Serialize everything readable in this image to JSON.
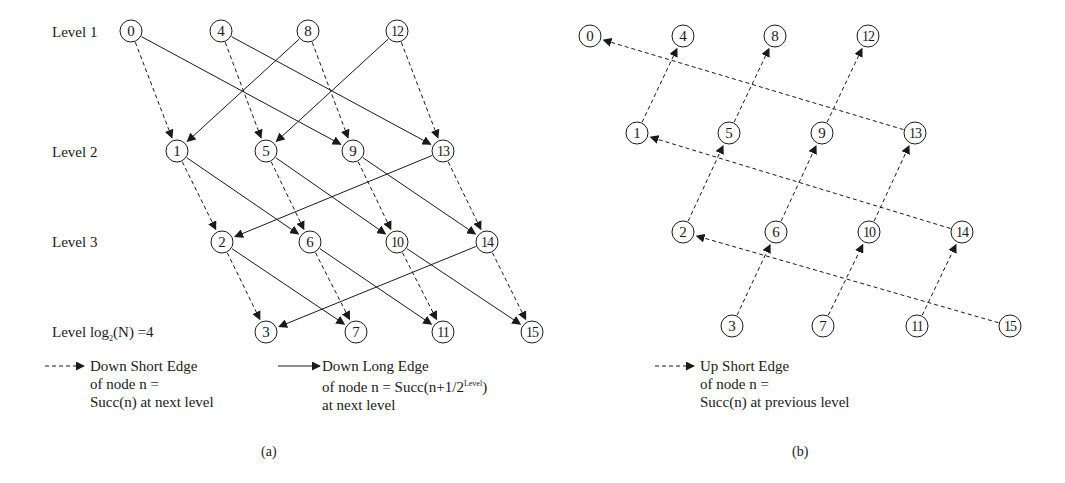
{
  "panel_a": {
    "caption": "(a)",
    "level_labels": [
      {
        "text": "Level  1",
        "x": 52,
        "y": 23
      },
      {
        "text": "Level  2",
        "x": 52,
        "y": 143
      },
      {
        "text": "Level  3",
        "x": 52,
        "y": 233
      },
      {
        "text_prefix": "Level  log",
        "subscript": "2",
        "text_suffix": "(N) =4",
        "x": 52,
        "y": 323
      }
    ],
    "nodes": [
      {
        "id": "0",
        "x": 131,
        "y": 31
      },
      {
        "id": "4",
        "x": 221,
        "y": 31
      },
      {
        "id": "8",
        "x": 308,
        "y": 31
      },
      {
        "id": "12",
        "x": 397,
        "y": 31
      },
      {
        "id": "1",
        "x": 177,
        "y": 151
      },
      {
        "id": "5",
        "x": 266,
        "y": 151
      },
      {
        "id": "9",
        "x": 353,
        "y": 151
      },
      {
        "id": "13",
        "x": 443,
        "y": 151
      },
      {
        "id": "2",
        "x": 222,
        "y": 242
      },
      {
        "id": "6",
        "x": 310,
        "y": 242
      },
      {
        "id": "10",
        "x": 397,
        "y": 242
      },
      {
        "id": "14",
        "x": 487,
        "y": 242
      },
      {
        "id": "3",
        "x": 266,
        "y": 332
      },
      {
        "id": "7",
        "x": 356,
        "y": 332
      },
      {
        "id": "11",
        "x": 443,
        "y": 332
      },
      {
        "id": "15",
        "x": 532,
        "y": 332
      }
    ],
    "short_edges": [
      [
        "0",
        "1"
      ],
      [
        "4",
        "5"
      ],
      [
        "8",
        "9"
      ],
      [
        "12",
        "13"
      ],
      [
        "1",
        "2"
      ],
      [
        "5",
        "6"
      ],
      [
        "9",
        "10"
      ],
      [
        "13",
        "14"
      ],
      [
        "2",
        "3"
      ],
      [
        "6",
        "7"
      ],
      [
        "10",
        "11"
      ],
      [
        "14",
        "15"
      ]
    ],
    "long_edges": [
      [
        "0",
        "9"
      ],
      [
        "4",
        "13"
      ],
      [
        "8",
        "1"
      ],
      [
        "12",
        "5"
      ],
      [
        "1",
        "6"
      ],
      [
        "5",
        "10"
      ],
      [
        "9",
        "14"
      ],
      [
        "13",
        "2"
      ],
      [
        "2",
        "7"
      ],
      [
        "6",
        "11"
      ],
      [
        "10",
        "15"
      ],
      [
        "14",
        "3"
      ]
    ],
    "legend": {
      "short": {
        "line1": "Down Short Edge",
        "line2": "of node n =",
        "line3": "Succ(n) at next level"
      },
      "long": {
        "line1": "Down Long Edge",
        "line2_prefix": "of node n = Succ(n+1/2",
        "line2_sup": "Level",
        "line2_suffix": ")",
        "line3": "at next level"
      }
    }
  },
  "panel_b": {
    "caption": "(b)",
    "nodes": [
      {
        "id": "0",
        "x": 590,
        "y": 36
      },
      {
        "id": "4",
        "x": 683,
        "y": 36
      },
      {
        "id": "8",
        "x": 775,
        "y": 36
      },
      {
        "id": "12",
        "x": 868,
        "y": 36
      },
      {
        "id": "1",
        "x": 637,
        "y": 133
      },
      {
        "id": "5",
        "x": 729,
        "y": 133
      },
      {
        "id": "9",
        "x": 822,
        "y": 133
      },
      {
        "id": "13",
        "x": 915,
        "y": 133
      },
      {
        "id": "2",
        "x": 683,
        "y": 232
      },
      {
        "id": "6",
        "x": 776,
        "y": 232
      },
      {
        "id": "10",
        "x": 869,
        "y": 232
      },
      {
        "id": "14",
        "x": 962,
        "y": 232
      },
      {
        "id": "3",
        "x": 732,
        "y": 326
      },
      {
        "id": "7",
        "x": 823,
        "y": 326
      },
      {
        "id": "11",
        "x": 917,
        "y": 326
      },
      {
        "id": "15",
        "x": 1010,
        "y": 326
      }
    ],
    "up_edges": [
      [
        "1",
        "4"
      ],
      [
        "5",
        "8"
      ],
      [
        "9",
        "12"
      ],
      [
        "13",
        "0"
      ],
      [
        "2",
        "5"
      ],
      [
        "6",
        "9"
      ],
      [
        "10",
        "13"
      ],
      [
        "14",
        "1"
      ],
      [
        "3",
        "6"
      ],
      [
        "7",
        "10"
      ],
      [
        "11",
        "14"
      ],
      [
        "15",
        "2"
      ]
    ],
    "legend": {
      "line1": "Up Short Edge",
      "line2": "of node n =",
      "line3": "Succ(n) at previous level"
    }
  },
  "style": {
    "stroke": "#1a1a1a",
    "node_radius": 11
  }
}
